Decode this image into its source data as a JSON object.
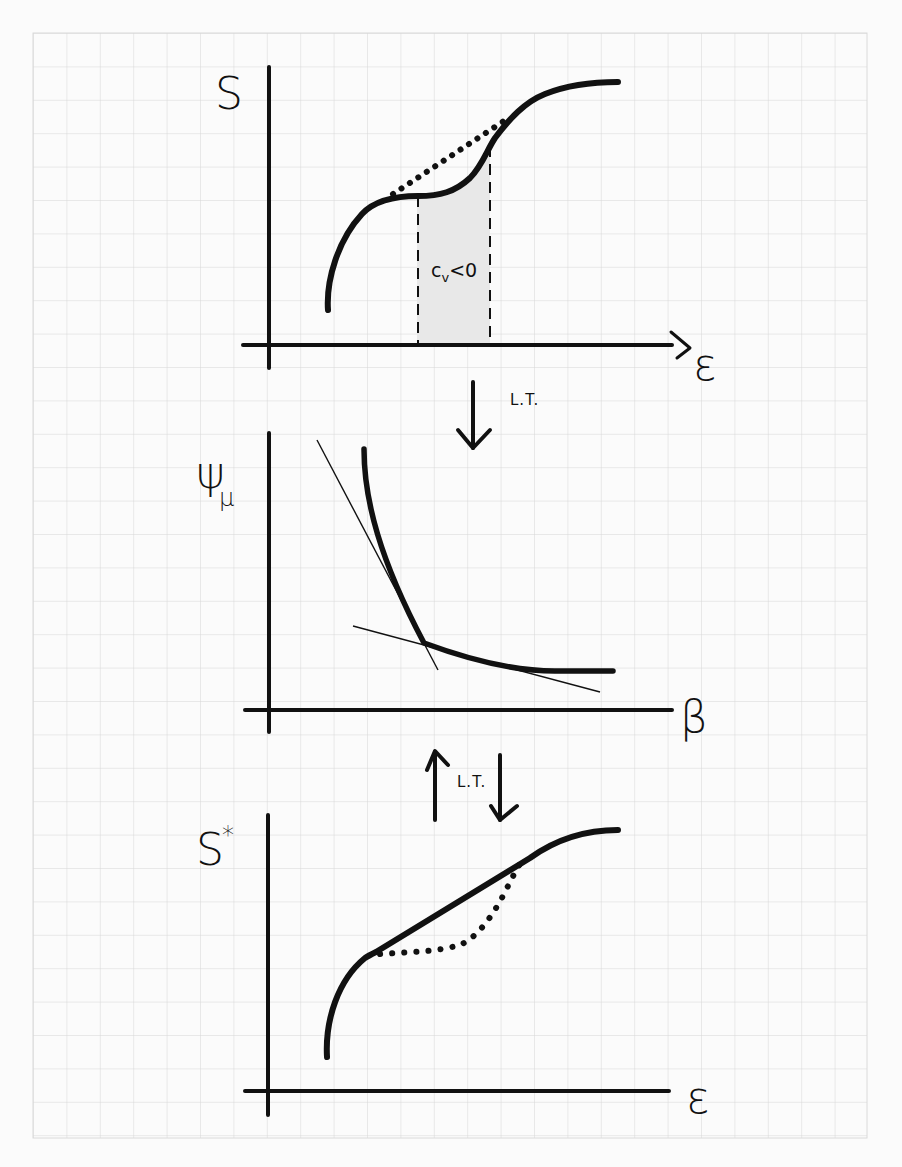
{
  "figure": {
    "background": "graph paper",
    "colors": {
      "ink": "#111111",
      "grid": "#d4d4d4",
      "shade": "#e6e6e6",
      "paper": "#fbfbfb"
    },
    "panels": [
      {
        "id": "top",
        "y_label": "S",
        "x_label": "ε",
        "curve": "non-concave entropy S(ε) with a convex intruder",
        "dotted": "concave hull segment over the convex region",
        "shaded_region_label": "c",
        "shaded_region_label_sub": "v",
        "shaded_region_label_rest": "<0"
      },
      {
        "id": "middle",
        "y_label": "ψ",
        "y_label_sub": "μ",
        "x_label": "β",
        "curve": "free-energy-like ψ(β) with a kink; two tangent lines at the kink"
      },
      {
        "id": "bottom",
        "y_label": "S",
        "y_label_sup": "*",
        "x_label": "ε",
        "curve": "concave envelope S*(ε) with a linear segment",
        "dotted": "original non-concave S(ε) below the envelope"
      }
    ],
    "arrows": [
      {
        "id": "top-to-middle",
        "direction": "down",
        "label": "L.T."
      },
      {
        "id": "middle-bottom-up",
        "direction": "up",
        "label": "L.T."
      },
      {
        "id": "middle-bottom-down",
        "direction": "down",
        "label": ""
      }
    ]
  }
}
